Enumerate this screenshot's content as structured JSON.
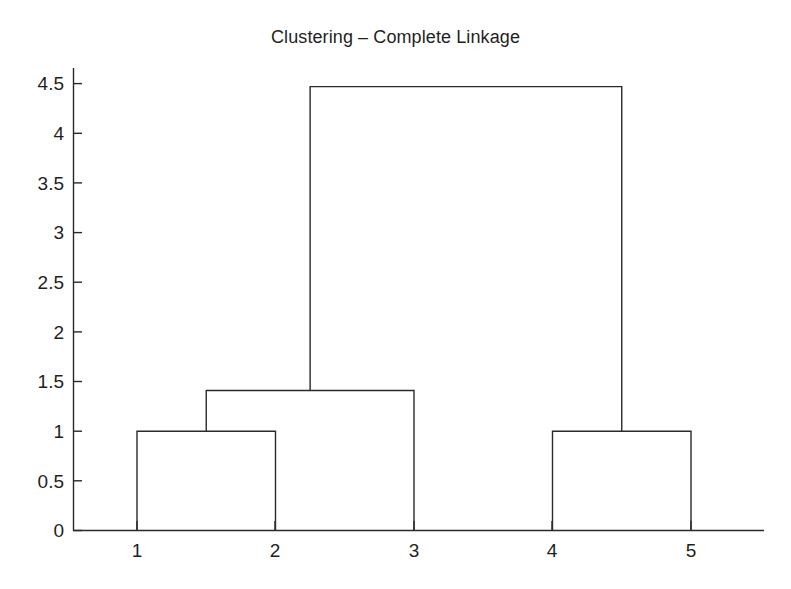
{
  "figure": {
    "title": "Clustering – Complete Linkage",
    "background_color": "#ffffff",
    "line_color": "#2a2a2a",
    "text_color": "#1f1f1f"
  },
  "chart_data": {
    "type": "line",
    "subtype": "dendrogram",
    "title": "Clustering – Complete Linkage",
    "xlabel": "",
    "ylabel": "",
    "grid": false,
    "legend": null,
    "xlim": [
      0.5,
      5.5
    ],
    "ylim": [
      0,
      4.75
    ],
    "leaves": [
      "1",
      "2",
      "3",
      "4",
      "5"
    ],
    "leaf_positions": [
      1,
      2,
      3,
      4,
      5
    ],
    "xticks": [
      1,
      2,
      3,
      4,
      5
    ],
    "xtick_labels": [
      "1",
      "2",
      "3",
      "4",
      "5"
    ],
    "yticks": [
      0,
      0.5,
      1,
      1.5,
      2,
      2.5,
      3,
      3.5,
      4,
      4.5
    ],
    "ytick_labels": [
      "0",
      "0.5",
      "1",
      "1.5",
      "2",
      "2.5",
      "3",
      "3.5",
      "4",
      "4.5"
    ],
    "links": [
      {
        "id": "link-1-2",
        "label": "1 + 2",
        "left_x": 1,
        "right_x": 2,
        "left_height": 0,
        "right_height": 0,
        "merge_height": 1.0,
        "center_x": 1.5
      },
      {
        "id": "link-12-3",
        "label": "(1,2) + 3",
        "left_x": 1.5,
        "right_x": 3,
        "left_height": 1.0,
        "right_height": 0,
        "merge_height": 1.41,
        "center_x": 2.25
      },
      {
        "id": "link-4-5",
        "label": "4 + 5",
        "left_x": 4,
        "right_x": 5,
        "left_height": 0,
        "right_height": 0,
        "merge_height": 1.0,
        "center_x": 4.5
      },
      {
        "id": "link-123-45",
        "label": "(1,2,3) + (4,5)",
        "left_x": 2.25,
        "right_x": 4.5,
        "left_height": 1.41,
        "right_height": 1.0,
        "merge_height": 4.47,
        "center_x": 3.375
      }
    ]
  }
}
